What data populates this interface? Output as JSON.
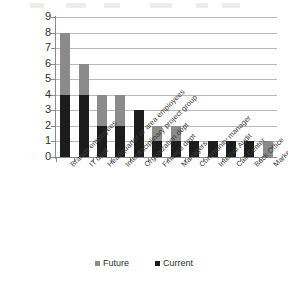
{
  "chart_data": {
    "type": "bar",
    "subtype": "stacked-column",
    "title": "",
    "xlabel": "",
    "ylabel": "",
    "ylim": [
      0,
      9
    ],
    "ytick_labels": [
      "0",
      "1",
      "2",
      "3",
      "4",
      "5",
      "6",
      "7",
      "8",
      "9"
    ],
    "grid": "horizontal",
    "legend_position": "bottom",
    "categories": [
      "Branch employees",
      "IT dept",
      "Headquarter or area employees",
      "Interdisciplinary project group",
      "Organization dept",
      "Finance dept",
      "Managers",
      "Community manager",
      "Internal Audit",
      "Call Center",
      "Back Office",
      "Marketing"
    ],
    "series": [
      {
        "name": "Current",
        "color": "#1c1c1c",
        "values": [
          4,
          4,
          2,
          2,
          3,
          1,
          1,
          1,
          1,
          1,
          1,
          0
        ]
      },
      {
        "name": "Future",
        "color": "#8b8b8b",
        "values": [
          4,
          2,
          2,
          2,
          0,
          1,
          1,
          0,
          0,
          0,
          0,
          1
        ]
      }
    ],
    "totals": [
      8,
      6,
      4,
      4,
      3,
      2,
      2,
      1,
      1,
      1,
      1,
      1
    ]
  },
  "legend": {
    "items": [
      {
        "label": "Future",
        "color": "#8b8b8b"
      },
      {
        "label": "Current",
        "color": "#1c1c1c"
      }
    ]
  },
  "axis": {
    "line_color": "#8a8a8a",
    "grid_color": "#b9b9b9"
  }
}
